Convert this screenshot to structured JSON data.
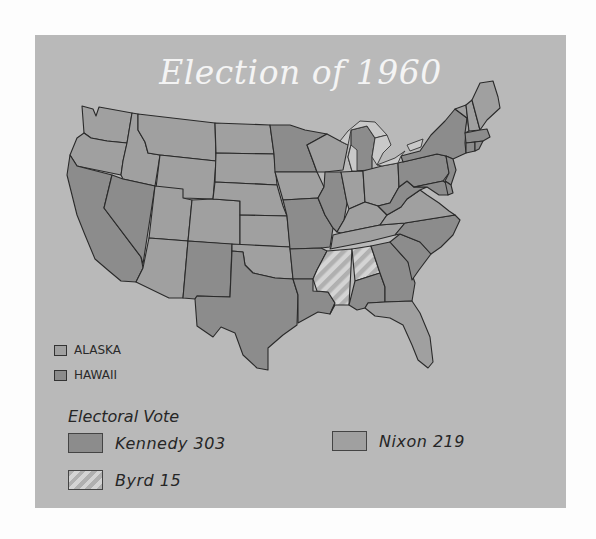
{
  "map": {
    "title": "Election of 1960",
    "colors": {
      "kennedy": "#8c8c8c",
      "nixon": "#a0a0a0",
      "byrd_stripe_a": "#b0b0b0",
      "byrd_stripe_b": "#d4d4d4",
      "panel_background": "#b9b9b9",
      "lakes": "#c9c9c9"
    },
    "territories": [
      {
        "label": "ALASKA",
        "winner": "nixon"
      },
      {
        "label": "HAWAII",
        "winner": "kennedy"
      }
    ],
    "legend": {
      "title": "Electoral Vote",
      "items": [
        {
          "label": "Kennedy 303",
          "candidate": "Kennedy",
          "votes": 303,
          "pattern": "dark-gray"
        },
        {
          "label": "Nixon 219",
          "candidate": "Nixon",
          "votes": 219,
          "pattern": "light-gray"
        },
        {
          "label": "Byrd 15",
          "candidate": "Byrd",
          "votes": 15,
          "pattern": "striped"
        }
      ]
    }
  }
}
